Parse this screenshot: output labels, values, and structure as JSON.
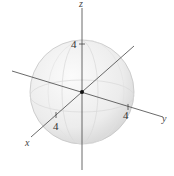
{
  "figure": {
    "type": "sphere-in-3d-axes",
    "radius_label": "4",
    "axes": {
      "x": {
        "label": "x",
        "tick_label": "4"
      },
      "y": {
        "label": "y",
        "tick_label": "4"
      },
      "z": {
        "label": "z",
        "tick_label": "4"
      }
    },
    "colors": {
      "sphere_fill": "#eeeeee",
      "sphere_edge": "#bbbbbb",
      "axis": "#444444"
    }
  }
}
